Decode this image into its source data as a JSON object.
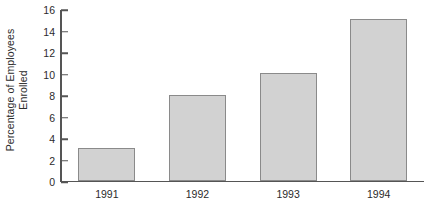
{
  "chart_data": {
    "type": "bar",
    "title": "",
    "subtitle": "",
    "categories": [
      "1991",
      "1992",
      "1993",
      "1994"
    ],
    "values": [
      3,
      8,
      10,
      15
    ],
    "series": [
      {
        "name": "Percentage of Employees Enrolled",
        "values": [
          3,
          8,
          10,
          15
        ]
      }
    ],
    "xlabel": "",
    "ylabel": "Percentage of Employees Enrolled",
    "ylabel_lines": [
      "Percentage of Employees",
      "Enrolled"
    ],
    "ylim": [
      0,
      16
    ],
    "ytick_step": 2,
    "yticks": [
      0,
      2,
      4,
      6,
      8,
      10,
      12,
      14,
      16
    ],
    "ytick_labels": [
      "0",
      "2",
      "4",
      "6",
      "8",
      "10",
      "12",
      "14",
      "16"
    ],
    "xticks": [
      "1991",
      "1992",
      "1993",
      "1994"
    ],
    "grid": false,
    "legend": false,
    "legend_position": "none",
    "annotations": [],
    "colors": {
      "background": "#ffffff",
      "bar_fill": "#d2d2d2",
      "bar_edge": "#8a8a8a",
      "axis": "#555555",
      "text": "#2b2b2b"
    }
  }
}
